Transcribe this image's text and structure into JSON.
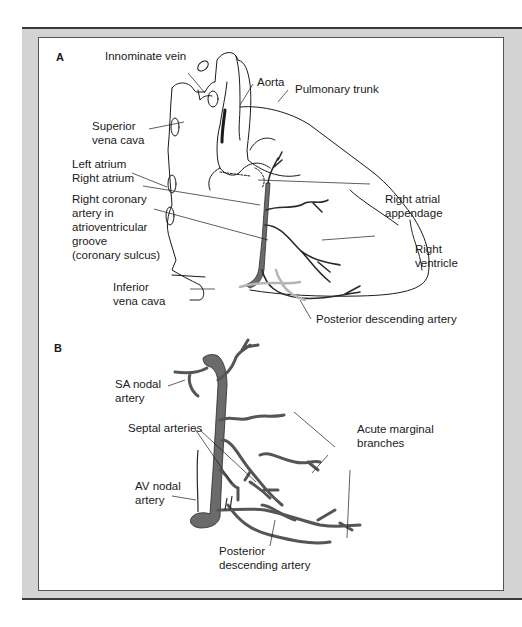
{
  "figure": {
    "panel_a": {
      "letter": "A",
      "labels": {
        "innominate_vein": "Innominate vein",
        "aorta": "Aorta",
        "pulmonary_trunk": "Pulmonary trunk",
        "superior_vena_cava_1": "Superior",
        "superior_vena_cava_2": "vena cava",
        "left_atrium": "Left atrium",
        "right_atrium": "Right atrium",
        "rca_1": "Right coronary",
        "rca_2": "artery in",
        "rca_3": "atrioventricular",
        "rca_4": "groove",
        "rca_5": "(coronary sulcus)",
        "right_atrial_appendage_1": "Right atrial",
        "right_atrial_appendage_2": "appendage",
        "right_ventricle_1": "Right",
        "right_ventricle_2": "ventricle",
        "inferior_vena_cava_1": "Inferior",
        "inferior_vena_cava_2": "vena cava",
        "posterior_descending_artery": "Posterior descending artery"
      }
    },
    "panel_b": {
      "letter": "B",
      "labels": {
        "sa_nodal_1": "SA nodal",
        "sa_nodal_2": "artery",
        "septal_arteries": "Septal arteries",
        "acute_marginal_1": "Acute marginal",
        "acute_marginal_2": "branches",
        "av_nodal_1": "AV nodal",
        "av_nodal_2": "artery",
        "pda_1": "Posterior",
        "pda_2": "descending artery"
      }
    },
    "colors": {
      "frame_gray": "#d3d3d3",
      "artery_fill": "#6b6b6b",
      "posterior_artery_light": "#b5b5b5",
      "outline": "#1a1a1a"
    }
  }
}
